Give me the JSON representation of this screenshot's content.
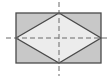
{
  "diagram": {
    "colors": {
      "background": "#ffffff",
      "rectangle_fill": "#c8c8c8",
      "rhombus_fill": "#ececec",
      "stroke": "#4a4a4a",
      "axis": "#6a6a6a"
    },
    "rectangle": {
      "x": 16,
      "y": 13,
      "width": 85,
      "height": 50
    },
    "rhombus": {
      "points": "16,38 59,13 101,38 59,63"
    },
    "axes": {
      "vertical": {
        "x1": 59,
        "y1": 2,
        "x2": 59,
        "y2": 76
      },
      "horizontal": {
        "x1": 6,
        "y1": 38,
        "x2": 108,
        "y2": 38
      }
    }
  }
}
